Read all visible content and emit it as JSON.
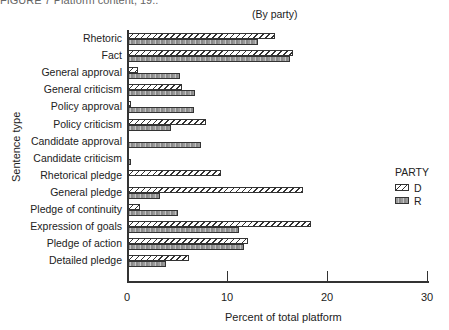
{
  "header": {
    "top_cut_text": "FIGURE 7   Platform content, 19..",
    "subtitle": "(By party)"
  },
  "chart_data": {
    "type": "bar",
    "orientation": "horizontal",
    "title": "",
    "subtitle": "(By party)",
    "xlabel": "Percent of total platform",
    "ylabel": "Sentence type",
    "xlim": [
      0,
      30
    ],
    "xticks": [
      0,
      10,
      20,
      30
    ],
    "grid": false,
    "legend": {
      "title": "PARTY",
      "position": "right",
      "entries": [
        "D",
        "R"
      ]
    },
    "categories": [
      "Rhetoric",
      "Fact",
      "General approval",
      "General criticism",
      "Policy approval",
      "Policy criticism",
      "Candidate approval",
      "Candidate criticism",
      "Rhetorical pledge",
      "General pledge",
      "Pledge of continuity",
      "Expression of goals",
      "Pledge of action",
      "Detailed pledge"
    ],
    "series": [
      {
        "name": "D",
        "pattern": "hatched",
        "values": [
          14.8,
          16.6,
          1.1,
          5.5,
          0.4,
          7.9,
          0.0,
          0.0,
          9.4,
          17.6,
          1.3,
          18.4,
          12.1,
          6.2
        ]
      },
      {
        "name": "R",
        "pattern": "stippled",
        "values": [
          13.1,
          16.3,
          5.3,
          6.8,
          6.7,
          4.4,
          7.4,
          0.4,
          0.0,
          3.3,
          5.1,
          11.2,
          11.7,
          3.9
        ]
      }
    ]
  },
  "colors": {
    "axis": "#333333",
    "d_fill": "#ffffff",
    "r_fill": "#a0a0a0"
  }
}
